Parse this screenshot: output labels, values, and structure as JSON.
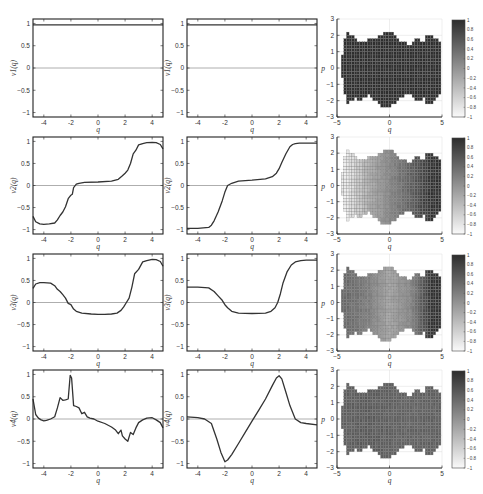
{
  "figure": {
    "rows": 4,
    "columns": [
      "left line plot",
      "middle line plot",
      "heatmap with colorbar"
    ]
  },
  "chart_data": [
    {
      "type": "line",
      "row": 1,
      "col": 1,
      "ylabel": "v1(q)",
      "xlabel": "q",
      "xlim": [
        -4.8,
        4.8
      ],
      "ylim": [
        -1.1,
        1.1
      ],
      "xticks": [
        -4,
        -2,
        0,
        2,
        4
      ],
      "yticks": [
        1,
        0.5,
        0,
        -0.5,
        -1
      ],
      "reference_line": 0,
      "x": [
        -4.8,
        4.8
      ],
      "y": [
        0.97,
        0.97
      ]
    },
    {
      "type": "line",
      "row": 1,
      "col": 2,
      "ylabel": "v1(q)",
      "xlabel": "q",
      "xlim": [
        -4.8,
        4.8
      ],
      "ylim": [
        -1.1,
        1.1
      ],
      "xticks": [
        -4,
        -2,
        0,
        2,
        4
      ],
      "yticks": [
        1,
        0.5,
        0,
        -0.5,
        -1
      ],
      "reference_line": 0,
      "x": [
        -4.8,
        4.8
      ],
      "y": [
        0.97,
        0.97
      ]
    },
    {
      "type": "heatmap",
      "row": 1,
      "col": 3,
      "ylabel": "p",
      "xlabel": "q",
      "xlim": [
        -5,
        5
      ],
      "ylim": [
        -3,
        3
      ],
      "xticks": [
        -5,
        0,
        5
      ],
      "yticks": [
        3,
        2,
        1,
        0,
        -1,
        -2,
        -3
      ],
      "colorbar": {
        "min": -1,
        "max": 1,
        "ticks": [
          1,
          0.8,
          0.6,
          0.4,
          0.2,
          0,
          -0.2,
          -0.4,
          -0.6,
          -0.8,
          -1
        ]
      },
      "profile": "uniform",
      "values_q": [
        -4,
        -2,
        0,
        2,
        4
      ],
      "values": [
        1,
        1,
        1,
        1,
        1
      ]
    },
    {
      "type": "line",
      "row": 2,
      "col": 1,
      "ylabel": "v2(q)",
      "xlabel": "q",
      "xlim": [
        -4.8,
        4.8
      ],
      "ylim": [
        -1.1,
        1.1
      ],
      "xticks": [
        -4,
        -2,
        0,
        2,
        4
      ],
      "yticks": [
        1,
        0.5,
        0,
        -0.5,
        -1
      ],
      "reference_line": 0,
      "x": [
        -4.8,
        -4.6,
        -4.3,
        -4,
        -3.6,
        -3.2,
        -3,
        -2.8,
        -2.6,
        -2.4,
        -2.2,
        -2,
        -1.9,
        -1.8,
        -1.6,
        -1.4,
        -1,
        0,
        1,
        1.5,
        1.8,
        2,
        2.2,
        2.4,
        2.6,
        2.8,
        3,
        3.3,
        3.6,
        4,
        4.3,
        4.6,
        4.8
      ],
      "y": [
        -0.7,
        -0.82,
        -0.87,
        -0.88,
        -0.87,
        -0.85,
        -0.78,
        -0.68,
        -0.6,
        -0.48,
        -0.3,
        -0.22,
        -0.2,
        -0.05,
        0.03,
        0.05,
        0.07,
        0.08,
        0.1,
        0.14,
        0.22,
        0.28,
        0.35,
        0.5,
        0.72,
        0.8,
        0.92,
        0.95,
        0.97,
        0.98,
        0.97,
        0.93,
        0.83
      ]
    },
    {
      "type": "line",
      "row": 2,
      "col": 2,
      "ylabel": "v2(q)",
      "xlabel": "q",
      "xlim": [
        -4.8,
        4.8
      ],
      "ylim": [
        -1.1,
        1.1
      ],
      "xticks": [
        -4,
        -2,
        0,
        2,
        4
      ],
      "yticks": [
        1,
        0.5,
        0,
        -0.5,
        -1
      ],
      "reference_line": 0,
      "x": [
        -4.8,
        -4,
        -3.2,
        -3,
        -2.8,
        -2.5,
        -2.2,
        -2,
        -1.8,
        -1.5,
        -1,
        0,
        1,
        1.5,
        1.8,
        2,
        2.2,
        2.5,
        2.8,
        3,
        3.2,
        3.5,
        4,
        4.8
      ],
      "y": [
        -0.97,
        -0.97,
        -0.95,
        -0.9,
        -0.8,
        -0.6,
        -0.35,
        -0.15,
        0.0,
        0.05,
        0.1,
        0.12,
        0.15,
        0.2,
        0.28,
        0.38,
        0.52,
        0.72,
        0.88,
        0.93,
        0.95,
        0.96,
        0.96,
        0.96
      ]
    },
    {
      "type": "heatmap",
      "row": 2,
      "col": 3,
      "ylabel": "p",
      "xlabel": "q",
      "xlim": [
        -5,
        5
      ],
      "ylim": [
        -3,
        3
      ],
      "xticks": [
        -5,
        0,
        5
      ],
      "yticks": [
        3,
        2,
        1,
        0,
        -1,
        -2,
        -3
      ],
      "colorbar": {
        "min": -1,
        "max": 1,
        "ticks": [
          1,
          0.8,
          0.6,
          0.4,
          0.2,
          0,
          -0.2,
          -0.4,
          -0.6,
          -0.8,
          -1
        ]
      },
      "profile": "gradient light-left to dark-right",
      "values_q": [
        -4,
        -2,
        0,
        2,
        4
      ],
      "values": [
        -0.85,
        -0.3,
        0.1,
        0.5,
        0.95
      ]
    },
    {
      "type": "line",
      "row": 3,
      "col": 1,
      "ylabel": "v3(q)",
      "xlabel": "q",
      "xlim": [
        -4.8,
        4.8
      ],
      "ylim": [
        -1.1,
        1.1
      ],
      "xticks": [
        -4,
        -2,
        0,
        2,
        4
      ],
      "yticks": [
        1,
        0.5,
        0,
        -0.5,
        -1
      ],
      "reference_line": 0,
      "x": [
        -4.8,
        -4.6,
        -4.3,
        -4,
        -3.5,
        -3.2,
        -3,
        -2.8,
        -2.6,
        -2.4,
        -2.2,
        -2,
        -1.8,
        -1.6,
        -1.2,
        -0.5,
        0,
        0.5,
        1,
        1.4,
        1.7,
        1.9,
        2.1,
        2.3,
        2.5,
        2.7,
        3,
        3.3,
        3.6,
        4,
        4.3,
        4.6,
        4.8
      ],
      "y": [
        0.32,
        0.42,
        0.45,
        0.45,
        0.44,
        0.38,
        0.3,
        0.25,
        0.18,
        0.1,
        -0.02,
        -0.05,
        -0.15,
        -0.2,
        -0.24,
        -0.26,
        -0.27,
        -0.27,
        -0.26,
        -0.24,
        -0.18,
        -0.1,
        0.0,
        0.1,
        0.35,
        0.65,
        0.75,
        0.92,
        0.95,
        0.98,
        0.97,
        0.93,
        0.82
      ]
    },
    {
      "type": "line",
      "row": 3,
      "col": 2,
      "ylabel": "v3(q)",
      "xlabel": "q",
      "xlim": [
        -4.8,
        4.8
      ],
      "ylim": [
        -1.1,
        1.1
      ],
      "xticks": [
        -4,
        -2,
        0,
        2,
        4
      ],
      "yticks": [
        1,
        0.5,
        0,
        -0.5,
        -1
      ],
      "reference_line": 0,
      "x": [
        -4.8,
        -4,
        -3.2,
        -2.8,
        -2.5,
        -2.2,
        -2,
        -1.8,
        -1.5,
        -1,
        0,
        1,
        1.4,
        1.7,
        1.9,
        2.1,
        2.3,
        2.6,
        2.9,
        3.2,
        3.6,
        4,
        4.8
      ],
      "y": [
        0.35,
        0.35,
        0.33,
        0.25,
        0.15,
        0.05,
        -0.05,
        -0.12,
        -0.2,
        -0.24,
        -0.25,
        -0.24,
        -0.2,
        -0.12,
        0.0,
        0.2,
        0.45,
        0.7,
        0.85,
        0.92,
        0.95,
        0.96,
        0.96
      ]
    },
    {
      "type": "heatmap",
      "row": 3,
      "col": 3,
      "ylabel": "p",
      "xlabel": "q",
      "xlim": [
        -5,
        5
      ],
      "ylim": [
        -3,
        3
      ],
      "xticks": [
        -5,
        0,
        5
      ],
      "yticks": [
        3,
        2,
        1,
        0,
        -1,
        -2,
        -3
      ],
      "colorbar": {
        "min": -1,
        "max": 1,
        "ticks": [
          1,
          0.8,
          0.6,
          0.4,
          0.2,
          0,
          -0.2,
          -0.4,
          -0.6,
          -0.8,
          -1
        ]
      },
      "profile": "medium left, lighter center, dark right",
      "values_q": [
        -4,
        -2,
        0,
        2,
        4
      ],
      "values": [
        0.4,
        0.2,
        -0.2,
        0.1,
        0.95
      ]
    },
    {
      "type": "line",
      "row": 4,
      "col": 1,
      "ylabel": "v4(q)",
      "xlabel": "q",
      "xlim": [
        -4.8,
        4.8
      ],
      "ylim": [
        -1.1,
        1.1
      ],
      "xticks": [
        -4,
        -2,
        0,
        2,
        4
      ],
      "yticks": [
        1,
        0.5,
        0,
        -0.5,
        -1
      ],
      "reference_line": 0,
      "x": [
        -4.8,
        -4.6,
        -4.4,
        -4.2,
        -4,
        -3.8,
        -3.5,
        -3.2,
        -3,
        -2.8,
        -2.6,
        -2.4,
        -2.2,
        -2.05,
        -1.95,
        -1.8,
        -1.6,
        -1.4,
        -1.2,
        -1,
        -0.8,
        -0.6,
        -0.3,
        0,
        0.5,
        1,
        1.3,
        1.5,
        1.7,
        1.8,
        2,
        2.2,
        2.4,
        2.6,
        2.8,
        3,
        3.3,
        3.6,
        4,
        4.3,
        4.6,
        4.8
      ],
      "y": [
        0.45,
        0.1,
        0.02,
        -0.02,
        -0.04,
        -0.03,
        0.0,
        0.05,
        0.25,
        0.48,
        0.42,
        0.43,
        0.45,
        0.98,
        0.92,
        0.3,
        0.28,
        0.25,
        0.12,
        0.15,
        0.05,
        0.02,
        0.0,
        -0.05,
        -0.1,
        -0.18,
        -0.25,
        -0.33,
        -0.25,
        -0.38,
        -0.45,
        -0.5,
        -0.3,
        -0.35,
        -0.2,
        -0.08,
        -0.02,
        0.02,
        0.03,
        -0.02,
        -0.08,
        -0.2
      ]
    },
    {
      "type": "line",
      "row": 4,
      "col": 2,
      "ylabel": "v4(q)",
      "xlabel": "q",
      "xlim": [
        -4.8,
        4.8
      ],
      "ylim": [
        -1.1,
        1.1
      ],
      "xticks": [
        -4,
        -2,
        0,
        2,
        4
      ],
      "yticks": [
        1,
        0.5,
        0,
        -0.5,
        -1
      ],
      "reference_line": 0,
      "x": [
        -4.8,
        -4,
        -3.5,
        -3,
        -2.6,
        -2.3,
        -2,
        -1.8,
        -1.5,
        -1,
        -0.5,
        0,
        0.5,
        1,
        1.5,
        1.8,
        2,
        2.2,
        2.5,
        2.8,
        3.2,
        3.6,
        4,
        4.8
      ],
      "y": [
        0.05,
        0.03,
        0.0,
        -0.1,
        -0.45,
        -0.75,
        -0.96,
        -0.92,
        -0.8,
        -0.55,
        -0.3,
        -0.05,
        0.2,
        0.45,
        0.75,
        0.92,
        0.97,
        0.9,
        0.6,
        0.3,
        0.0,
        -0.08,
        -0.1,
        -0.13
      ]
    },
    {
      "type": "heatmap",
      "row": 4,
      "col": 3,
      "ylabel": "p",
      "xlabel": "q",
      "xlim": [
        -5,
        5
      ],
      "ylim": [
        -3,
        3
      ],
      "xticks": [
        -5,
        0,
        5
      ],
      "yticks": [
        3,
        2,
        1,
        0,
        -1,
        -2,
        -3
      ],
      "colorbar": {
        "min": -1,
        "max": 1,
        "ticks": [
          1,
          0.8,
          0.6,
          0.4,
          0.2,
          0,
          -0.2,
          -0.4,
          -0.6,
          -0.8,
          -1
        ]
      },
      "profile": "mostly medium-dark, fairly uniform",
      "values_q": [
        -4,
        -2,
        0,
        2,
        4
      ],
      "values": [
        0.5,
        0.55,
        0.5,
        0.45,
        0.5
      ]
    }
  ]
}
